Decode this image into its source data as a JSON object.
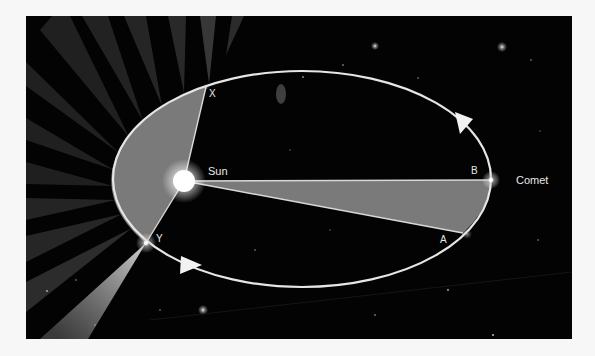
{
  "figure": {
    "background_color": "#030303",
    "orbit_color": "#e6e6e6",
    "sector_color": "#7a7a7a",
    "sun_color": "#ffffff"
  },
  "labels": {
    "sun": "Sun",
    "comet": "Comet",
    "point_x": "X",
    "point_y": "Y",
    "point_a": "A",
    "point_b": "B"
  },
  "orbit": {
    "center": [
      302,
      179
    ],
    "rx": 189,
    "ry": 108,
    "direction": "counter-clockwise (arrows on upper-right and lower-left)"
  },
  "points": {
    "sun": [
      184,
      181
    ],
    "x": [
      206,
      87
    ],
    "y": [
      146,
      243
    ],
    "a": [
      463,
      233
    ],
    "b": [
      491,
      180
    ]
  },
  "sectors": [
    {
      "name": "perihelion-sector",
      "from": "X",
      "to": "Y",
      "through": "Sun"
    },
    {
      "name": "aphelion-sector",
      "from": "A",
      "to": "B",
      "through": "Sun"
    }
  ]
}
